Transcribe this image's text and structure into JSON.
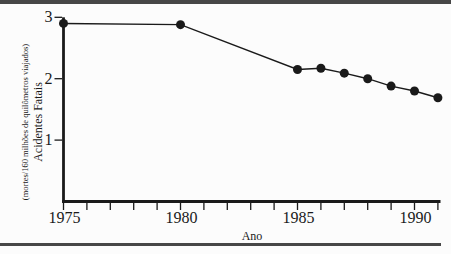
{
  "page": {
    "background": "#fcfcfc",
    "rule_color": "#474747",
    "ink_color": "#1a1a1a"
  },
  "chart_data": {
    "type": "line",
    "title": "",
    "xlabel": "Ano",
    "ylabel_line1": "Acidentes Fatais",
    "ylabel_line2": "(mortes/160 milhões de quilômetros viajados)",
    "x": [
      1975,
      1980,
      1985,
      1986,
      1987,
      1988,
      1989,
      1990,
      1991
    ],
    "values": [
      2.9,
      2.88,
      2.15,
      2.17,
      2.09,
      2.0,
      1.88,
      1.8,
      1.69
    ],
    "xlim": [
      1975,
      1991
    ],
    "ylim": [
      0,
      3
    ],
    "xticks": [
      1975,
      1976,
      1977,
      1978,
      1979,
      1980,
      1981,
      1982,
      1983,
      1984,
      1985,
      1986,
      1987,
      1988,
      1989,
      1990,
      1991
    ],
    "labeled_xticks": [
      1975,
      1980,
      1985,
      1990
    ],
    "yticks": [
      1,
      2,
      3
    ],
    "grid": false,
    "legend": null,
    "marker": "filled-circle",
    "line_color": "#1a1a1a"
  }
}
